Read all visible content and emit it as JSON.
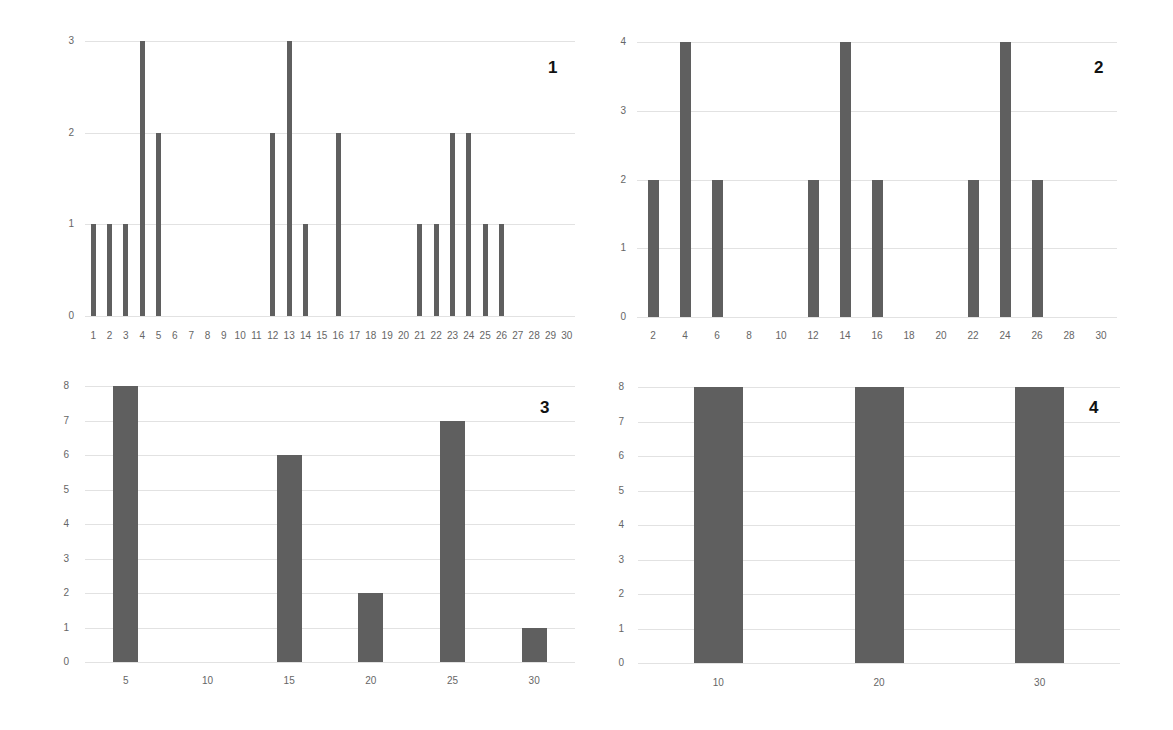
{
  "chart_data": [
    {
      "type": "bar",
      "panel_label": "1",
      "title": "",
      "xlabel": "",
      "ylabel": "",
      "categories": [
        1,
        2,
        3,
        4,
        5,
        6,
        7,
        8,
        9,
        10,
        11,
        12,
        13,
        14,
        15,
        16,
        17,
        18,
        19,
        20,
        21,
        22,
        23,
        24,
        25,
        26,
        27,
        28,
        29,
        30
      ],
      "values": [
        1,
        1,
        1,
        3,
        2,
        0,
        0,
        0,
        0,
        0,
        0,
        2,
        3,
        1,
        0,
        2,
        0,
        0,
        0,
        0,
        1,
        1,
        2,
        2,
        1,
        1,
        0,
        0,
        0,
        0
      ],
      "yticks": [
        0,
        1,
        2,
        3
      ],
      "ylim": [
        0,
        3
      ],
      "grid": true,
      "bar_color": "#5f5f5f"
    },
    {
      "type": "bar",
      "panel_label": "2",
      "title": "",
      "xlabel": "",
      "ylabel": "",
      "categories": [
        2,
        4,
        6,
        8,
        10,
        12,
        14,
        16,
        18,
        20,
        22,
        24,
        26,
        28,
        30
      ],
      "values": [
        2,
        4,
        2,
        0,
        0,
        2,
        4,
        2,
        0,
        0,
        2,
        4,
        2,
        0,
        0
      ],
      "yticks": [
        0,
        1,
        2,
        3,
        4
      ],
      "ylim": [
        0,
        4
      ],
      "grid": true,
      "bar_color": "#5f5f5f"
    },
    {
      "type": "bar",
      "panel_label": "3",
      "title": "",
      "xlabel": "",
      "ylabel": "",
      "categories": [
        5,
        10,
        15,
        20,
        25,
        30
      ],
      "values": [
        8,
        0,
        6,
        2,
        7,
        1
      ],
      "yticks": [
        0,
        1,
        2,
        3,
        4,
        5,
        6,
        7,
        8
      ],
      "ylim": [
        0,
        8
      ],
      "grid": true,
      "bar_color": "#5f5f5f"
    },
    {
      "type": "bar",
      "panel_label": "4",
      "title": "",
      "xlabel": "",
      "ylabel": "",
      "categories": [
        10,
        20,
        30
      ],
      "values": [
        8,
        8,
        8
      ],
      "yticks": [
        0,
        1,
        2,
        3,
        4,
        5,
        6,
        7,
        8
      ],
      "ylim": [
        0,
        8
      ],
      "grid": true,
      "bar_color": "#5f5f5f"
    }
  ],
  "layout": [
    {
      "left": 85,
      "right": 575,
      "top": 41,
      "bottom": 316,
      "tickY": 330,
      "barW": 5,
      "labelX": 548,
      "labelY": 58,
      "ytickX": 60
    },
    {
      "left": 637,
      "right": 1117,
      "top": 42,
      "bottom": 317,
      "tickY": 330,
      "barW": 11,
      "labelX": 1094,
      "labelY": 58,
      "ytickX": 612
    },
    {
      "left": 85,
      "right": 575,
      "top": 386,
      "bottom": 662,
      "tickY": 675,
      "barW": 25,
      "labelX": 540,
      "labelY": 398,
      "ytickX": 55
    },
    {
      "left": 638,
      "right": 1120,
      "top": 387,
      "bottom": 663,
      "tickY": 677,
      "barW": 49,
      "labelX": 1089,
      "labelY": 398,
      "ytickX": 610
    }
  ]
}
